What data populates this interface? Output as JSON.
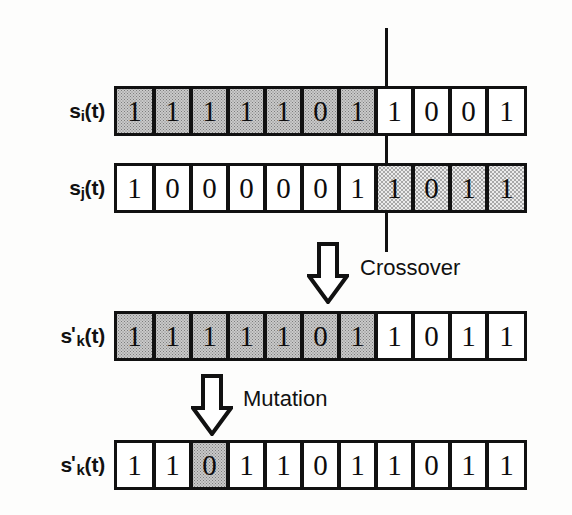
{
  "diagram": {
    "cut_line": {
      "name": "crossover-point-line",
      "x": 385,
      "top": 28,
      "bottom": 252
    },
    "colors": {
      "ink": "#111111",
      "paper": "#fdfdfc",
      "shade_dark": "#c9c9c9",
      "shade_light": "#ebebeb"
    },
    "rows": [
      {
        "id": "parent-1",
        "label_main": "s",
        "label_sub": "i",
        "label_prime": "",
        "label_tail": "(t)",
        "label_text": "si(t)",
        "y": 86,
        "genes": [
          "1",
          "1",
          "1",
          "1",
          "1",
          "0",
          "1",
          "1",
          "0",
          "0",
          "1"
        ],
        "shading": [
          "dark",
          "dark",
          "dark",
          "dark",
          "dark",
          "dark",
          "dark",
          "none",
          "none",
          "none",
          "none"
        ]
      },
      {
        "id": "parent-2",
        "label_main": "s",
        "label_sub": "j",
        "label_prime": "",
        "label_tail": "(t)",
        "label_text": "sj(t)",
        "y": 163,
        "genes": [
          "1",
          "0",
          "0",
          "0",
          "0",
          "0",
          "1",
          "1",
          "0",
          "1",
          "1"
        ],
        "shading": [
          "none",
          "none",
          "none",
          "none",
          "none",
          "none",
          "none",
          "light",
          "light",
          "light",
          "light"
        ]
      },
      {
        "id": "offspring-crossover",
        "label_main": "s",
        "label_sub": "k",
        "label_prime": "'",
        "label_tail": "(t)",
        "label_text": "s'k(t)",
        "y": 311,
        "genes": [
          "1",
          "1",
          "1",
          "1",
          "1",
          "0",
          "1",
          "1",
          "0",
          "1",
          "1"
        ],
        "shading": [
          "dark",
          "dark",
          "dark",
          "dark",
          "dark",
          "dark",
          "dark",
          "none",
          "none",
          "none",
          "none"
        ]
      },
      {
        "id": "offspring-mutated",
        "label_main": "s",
        "label_sub": "k",
        "label_prime": "'",
        "label_tail": "(t)",
        "label_text": "s'k(t)",
        "y": 440,
        "genes": [
          "1",
          "1",
          "0",
          "1",
          "1",
          "0",
          "1",
          "1",
          "0",
          "1",
          "1"
        ],
        "shading": [
          "none",
          "none",
          "dark",
          "none",
          "none",
          "none",
          "none",
          "none",
          "none",
          "none",
          "none"
        ]
      }
    ],
    "operators": [
      {
        "id": "crossover",
        "label": "Crossover",
        "arrow_name": "crossover-arrow-down-icon",
        "arrow_x": 307,
        "arrow_y": 242,
        "label_x": 360,
        "label_y": 255
      },
      {
        "id": "mutation",
        "label": "Mutation",
        "arrow_name": "mutation-arrow-down-icon",
        "arrow_x": 191,
        "arrow_y": 374,
        "label_x": 243,
        "label_y": 386
      }
    ]
  }
}
